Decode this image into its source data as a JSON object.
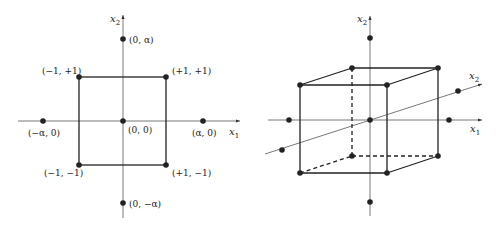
{
  "left_diagram": {
    "title": "2D central composite design",
    "axis_x": {
      "label": "x",
      "sub": "1"
    },
    "axis_y": {
      "label": "x",
      "sub": "2"
    },
    "points": [
      {
        "label": "(0, α)"
      },
      {
        "label": "(−1, +1)"
      },
      {
        "label": "(+1, +1)"
      },
      {
        "label": "(−α, 0)"
      },
      {
        "label": "(0, 0)"
      },
      {
        "label": "(α, 0)"
      },
      {
        "label": "(−1, −1)"
      },
      {
        "label": "(+1, −1)"
      },
      {
        "label": "(0, −α)"
      }
    ]
  },
  "right_diagram": {
    "title": "3D central composite design",
    "axis_x": {
      "label": "x",
      "sub": "1"
    },
    "axis_vertical": {
      "label": "x",
      "sub": "2"
    },
    "axis_depth": {
      "label": "x",
      "sub": "2"
    }
  },
  "colors": {
    "line": "#222222",
    "axis": "#555555",
    "background": "#ffffff"
  }
}
